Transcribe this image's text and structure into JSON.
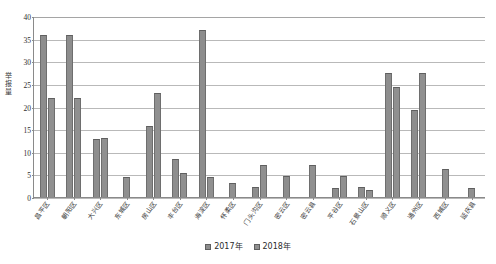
{
  "chart_data": {
    "type": "bar",
    "title": "",
    "xlabel": "",
    "ylabel": "举报量",
    "ylim": [
      0,
      40
    ],
    "yticks": [
      "0",
      "5",
      "10",
      "15",
      "20",
      "25",
      "30",
      "35",
      "40"
    ],
    "grid": true,
    "legend_position": "bottom",
    "categories": [
      "昌平区",
      "朝阳区",
      "大兴区",
      "东城区",
      "房山区",
      "丰台区",
      "海淀区",
      "怀柔区",
      "门头沟区",
      "密云区",
      "密云县",
      "平谷区",
      "石景山区",
      "顺义区",
      "通州区",
      "西城区",
      "延庆县"
    ],
    "series": [
      {
        "name": "2017年",
        "color": "#8d8d8d",
        "values": [
          35.8,
          35.8,
          12.8,
          0,
          15.7,
          8.3,
          37.0,
          0,
          2.2,
          4.7,
          0,
          2.1,
          2.2,
          27.5,
          19.2,
          0,
          0
        ]
      },
      {
        "name": "2018年",
        "color": "#909090",
        "values": [
          21.8,
          21.9,
          13.0,
          4.4,
          22.9,
          5.2,
          4.4,
          3.1,
          7.0,
          0,
          7.1,
          4.6,
          1.6,
          24.3,
          27.4,
          6.3,
          2.0
        ]
      }
    ]
  },
  "legend": {
    "items": [
      {
        "label": "2017年"
      },
      {
        "label": "2018年"
      }
    ]
  }
}
